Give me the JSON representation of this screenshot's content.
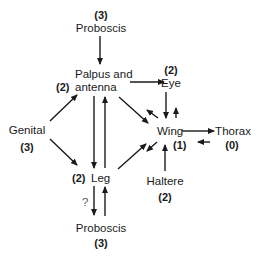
{
  "diagram": {
    "nodes": {
      "proboscis_top": {
        "label": "Proboscis",
        "level": "(3)"
      },
      "palpus": {
        "label_line1": "Palpus and",
        "label_line2": "antenna",
        "level": "(2)"
      },
      "eye": {
        "label": "Eye",
        "level": "(2)"
      },
      "genital": {
        "label": "Genital",
        "level": "(3)"
      },
      "wing": {
        "label": "Wing",
        "level": "(1)"
      },
      "thorax": {
        "label": "Thorax",
        "level": "(0)"
      },
      "leg": {
        "label": "Leg",
        "level": "(2)"
      },
      "haltere": {
        "label": "Haltere",
        "level": "(2)"
      },
      "proboscis_bottom": {
        "label": "Proboscis",
        "level": "(3)"
      }
    },
    "edges": [
      {
        "from": "proboscis_top",
        "to": "palpus"
      },
      {
        "from": "palpus",
        "to": "eye"
      },
      {
        "from": "palpus",
        "to": "wing"
      },
      {
        "from": "wing",
        "to": "palpus"
      },
      {
        "from": "palpus",
        "to": "leg"
      },
      {
        "from": "leg",
        "to": "palpus"
      },
      {
        "from": "genital",
        "to": "palpus"
      },
      {
        "from": "genital",
        "to": "leg"
      },
      {
        "from": "eye",
        "to": "wing"
      },
      {
        "from": "wing",
        "to": "eye"
      },
      {
        "from": "leg",
        "to": "wing"
      },
      {
        "from": "wing",
        "to": "leg"
      },
      {
        "from": "wing",
        "to": "thorax"
      },
      {
        "from": "thorax",
        "to": "wing"
      },
      {
        "from": "haltere",
        "to": "wing"
      },
      {
        "from": "leg",
        "to": "proboscis_bottom",
        "label": "?"
      },
      {
        "from": "proboscis_bottom",
        "to": "leg"
      }
    ],
    "uncertain_mark": "?"
  }
}
